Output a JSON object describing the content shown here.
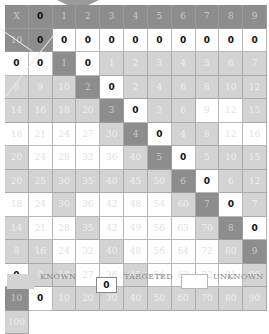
{
  "table": {
    "corner_label": "X",
    "col_headers": [
      "0",
      "1",
      "2",
      "3",
      "4",
      "5",
      "6",
      "7",
      "8",
      "9",
      "10"
    ],
    "row_headers": [
      "0",
      "1",
      "2",
      "3",
      "4",
      "5",
      "6",
      "7",
      "8",
      "9",
      "10"
    ],
    "known_factors": [
      1,
      2,
      5,
      10
    ],
    "rows": [
      [
        "0",
        "0",
        "0",
        "0",
        "0",
        "0",
        "0",
        "0",
        "0",
        "0",
        "0"
      ],
      [
        "0",
        "1",
        "2",
        "3",
        "4",
        "5",
        "6",
        "7",
        "8",
        "9",
        "10"
      ],
      [
        "0",
        "2",
        "4",
        "6",
        "8",
        "10",
        "12",
        "14",
        "16",
        "18",
        "20"
      ],
      [
        "0",
        "3",
        "6",
        "9",
        "12",
        "15",
        "18",
        "21",
        "24",
        "27",
        "30"
      ],
      [
        "0",
        "4",
        "8",
        "12",
        "16",
        "20",
        "24",
        "28",
        "32",
        "36",
        "40"
      ],
      [
        "0",
        "5",
        "10",
        "15",
        "20",
        "25",
        "30",
        "35",
        "40",
        "45",
        "50"
      ],
      [
        "0",
        "6",
        "12",
        "18",
        "24",
        "30",
        "36",
        "42",
        "48",
        "54",
        "60"
      ],
      [
        "0",
        "7",
        "14",
        "21",
        "28",
        "35",
        "42",
        "49",
        "56",
        "63",
        "70"
      ],
      [
        "0",
        "8",
        "16",
        "24",
        "32",
        "40",
        "48",
        "56",
        "64",
        "72",
        "80"
      ],
      [
        "0",
        "9",
        "18",
        "27",
        "36",
        "45",
        "54",
        "63",
        "72",
        "81",
        "90"
      ],
      [
        "0",
        "10",
        "20",
        "30",
        "40",
        "50",
        "60",
        "70",
        "80",
        "90",
        "100"
      ]
    ]
  },
  "legend": {
    "known_label": "KNOWN",
    "targeted_label": "TARGETED",
    "targeted_value": "0",
    "unknown_label": "UNKNOWN"
  },
  "colors": {
    "header_bg": "#8d8d8d",
    "known_bg": "#d3d3d3",
    "unknown_bg": "#ffffff"
  }
}
